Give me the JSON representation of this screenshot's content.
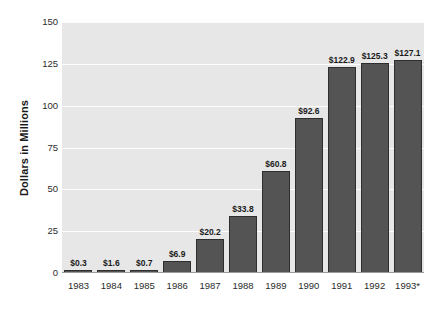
{
  "chart_data": {
    "type": "bar",
    "title": "",
    "xlabel": "",
    "ylabel": "Dollars in Millions",
    "categories": [
      "1983",
      "1984",
      "1985",
      "1986",
      "1987",
      "1988",
      "1989",
      "1990",
      "1991",
      "1992",
      "1993*"
    ],
    "values": [
      0.3,
      1.6,
      0.7,
      6.9,
      20.2,
      33.8,
      60.8,
      92.6,
      122.9,
      125.3,
      127.1
    ],
    "data_labels": [
      "$0.3",
      "$1.6",
      "$0.7",
      "$6.9",
      "$20.2",
      "$33.8",
      "$60.8",
      "$92.6",
      "$122.9",
      "$125.3",
      "$127.1"
    ],
    "ylim": [
      0,
      150
    ],
    "yticks": [
      0,
      25,
      50,
      75,
      100,
      125,
      150
    ],
    "ytick_labels": [
      "0",
      "25",
      "50",
      "75",
      "100",
      "125",
      "150"
    ],
    "grid": true,
    "legend": "none",
    "colors": {
      "bar_fill": "#545454",
      "bar_edge": "#2e2e2e",
      "plot_background": "#e7e7e7",
      "gridline": "#fdfdfd",
      "text": "#1a1a1a",
      "page_background": "#ffffff"
    }
  }
}
